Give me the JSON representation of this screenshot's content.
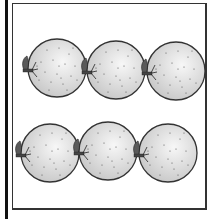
{
  "worksheet": {
    "object_name": "orange",
    "count": 6,
    "rows": 2,
    "columns": 3,
    "colors": {
      "fruit_fill_light": "#f4f4f4",
      "fruit_fill_dark": "#c9c9c9",
      "outline": "#333333",
      "dots": "#555555",
      "frame": "#333333",
      "left_bar": "#111111"
    },
    "items": [
      {
        "name": "orange-1",
        "cx": 57,
        "cy": 68,
        "r": 29
      },
      {
        "name": "orange-2",
        "cx": 116,
        "cy": 70,
        "r": 29
      },
      {
        "name": "orange-3",
        "cx": 176,
        "cy": 71,
        "r": 29
      },
      {
        "name": "orange-4",
        "cx": 50,
        "cy": 153,
        "r": 29
      },
      {
        "name": "orange-5",
        "cx": 108,
        "cy": 151,
        "r": 29
      },
      {
        "name": "orange-6",
        "cx": 168,
        "cy": 153,
        "r": 29
      }
    ]
  }
}
